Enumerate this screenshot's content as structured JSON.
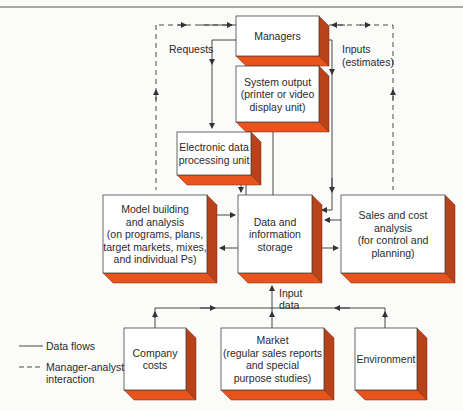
{
  "colors": {
    "face": "#ffffff",
    "bottom": "#e8541c",
    "side": "#b8431a",
    "line": "#333333",
    "background": "#fbfbfa"
  },
  "boxes": {
    "managers": [
      "Managers"
    ],
    "system_output": [
      "System output",
      "(printer or video",
      "display unit)"
    ],
    "edp": [
      "Electronic data",
      "processing unit"
    ],
    "model": [
      "Model building",
      "and analysis",
      "(on programs, plans,",
      "target markets, mixes,",
      "and individual Ps)"
    ],
    "storage": [
      "Data and",
      "information",
      "storage"
    ],
    "sales": [
      "Sales and cost",
      "analysis",
      "(for control and",
      "planning)"
    ],
    "costs": [
      "Company",
      "costs"
    ],
    "market": [
      "Market",
      "(regular sales reports",
      "and special",
      "purpose studies)"
    ],
    "environment": [
      "Environment"
    ]
  },
  "labels": {
    "requests": "Requests",
    "inputs": [
      "Inputs",
      "(estimates)"
    ],
    "input_data": [
      "Input",
      "data"
    ]
  },
  "legend": {
    "data_flows": "Data flows",
    "interaction": [
      "Manager-analyst",
      "interaction"
    ]
  }
}
